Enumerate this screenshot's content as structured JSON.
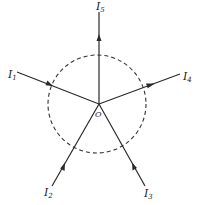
{
  "diagram": {
    "origin_label": "O",
    "line_color": "#2a2a2a",
    "circle_style": "dashed",
    "currents": [
      {
        "name": "I",
        "subscript": "1",
        "direction": "into_O"
      },
      {
        "name": "I",
        "subscript": "2",
        "direction": "into_O"
      },
      {
        "name": "I",
        "subscript": "3",
        "direction": "into_O"
      },
      {
        "name": "I",
        "subscript": "4",
        "direction": "out_of_O"
      },
      {
        "name": "I",
        "subscript": "5",
        "direction": "out_of_O"
      }
    ]
  }
}
